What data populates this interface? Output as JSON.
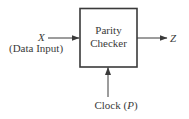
{
  "diagram": {
    "block": {
      "label_line1": "Parity",
      "label_line2": "Checker"
    },
    "input": {
      "symbol": "X",
      "description": "(Data Input)"
    },
    "output": {
      "symbol": "Z"
    },
    "clock": {
      "label": "Clock",
      "paren_open": "(",
      "symbol": "P",
      "paren_close": ")"
    },
    "colors": {
      "stroke": "#3a3a3a",
      "text": "#3a3a3a",
      "background": "#ffffff"
    }
  }
}
